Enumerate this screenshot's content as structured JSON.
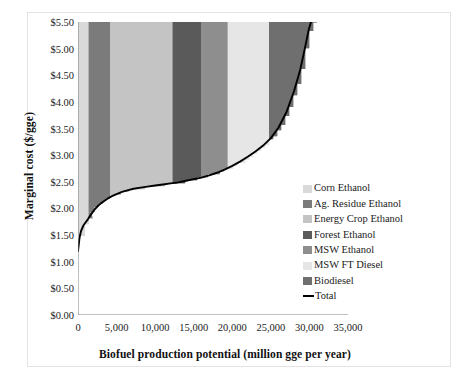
{
  "chart_data": {
    "type": "area",
    "title": "",
    "xlabel": "Biofuel production potential (million gge per year)",
    "ylabel": "Marginal cost ($/gge)",
    "xlim": [
      0,
      35000
    ],
    "ylim": [
      0.0,
      5.5
    ],
    "xticks": [
      "0",
      "5,000",
      "10,000",
      "15,000",
      "20,000",
      "25,000",
      "30,000",
      "35,000"
    ],
    "xtick_values": [
      0,
      5000,
      10000,
      15000,
      20000,
      25000,
      30000,
      35000
    ],
    "yticks": [
      "$0.00",
      "$0.50",
      "$1.00",
      "$1.50",
      "$2.00",
      "$2.50",
      "$3.00",
      "$3.50",
      "$4.00",
      "$4.50",
      "$5.00",
      "$5.50"
    ],
    "ytick_values": [
      0.0,
      0.5,
      1.0,
      1.5,
      2.0,
      2.5,
      3.0,
      3.5,
      4.0,
      4.5,
      5.0,
      5.5
    ],
    "grid": false,
    "legend_position": "right-inside",
    "series": [
      {
        "name": "Corn Ethanol",
        "color": "#d9d9d9",
        "x_start": 0,
        "x_end": 1400
      },
      {
        "name": "Ag. Residue Ethanol",
        "color": "#7b7b7b",
        "x_start": 1400,
        "x_end": 4200
      },
      {
        "name": "Energy Crop Ethanol",
        "color": "#c4c4c4",
        "x_start": 4200,
        "x_end": 12300
      },
      {
        "name": "Forest Ethanol",
        "color": "#5a5a5a",
        "x_start": 12300,
        "x_end": 16000
      },
      {
        "name": "MSW Ethanol",
        "color": "#8e8e8e",
        "x_start": 16000,
        "x_end": 19400
      },
      {
        "name": "MSW FT Diesel",
        "color": "#e6e6e6",
        "x_start": 19400,
        "x_end": 24800
      },
      {
        "name": "Biodiesel",
        "color": "#6f6f6f",
        "x_start": 24800,
        "x_end": 31000
      },
      {
        "name": "Total",
        "color": "#000000",
        "is_line": true
      }
    ],
    "total_curve": [
      [
        0,
        1.2
      ],
      [
        200,
        1.45
      ],
      [
        400,
        1.58
      ],
      [
        700,
        1.68
      ],
      [
        1000,
        1.74
      ],
      [
        1300,
        1.8
      ],
      [
        1600,
        1.87
      ],
      [
        1900,
        1.93
      ],
      [
        2200,
        1.99
      ],
      [
        2600,
        2.05
      ],
      [
        3000,
        2.1
      ],
      [
        3400,
        2.14
      ],
      [
        3900,
        2.19
      ],
      [
        4400,
        2.23
      ],
      [
        5000,
        2.27
      ],
      [
        5700,
        2.31
      ],
      [
        6400,
        2.34
      ],
      [
        7200,
        2.37
      ],
      [
        8100,
        2.39
      ],
      [
        9000,
        2.41
      ],
      [
        10000,
        2.43
      ],
      [
        11000,
        2.45
      ],
      [
        12000,
        2.47
      ],
      [
        13000,
        2.49
      ],
      [
        14000,
        2.52
      ],
      [
        15000,
        2.55
      ],
      [
        16000,
        2.58
      ],
      [
        17000,
        2.62
      ],
      [
        18000,
        2.67
      ],
      [
        19000,
        2.73
      ],
      [
        20000,
        2.8
      ],
      [
        21000,
        2.88
      ],
      [
        22000,
        2.97
      ],
      [
        23000,
        3.07
      ],
      [
        24000,
        3.18
      ],
      [
        25000,
        3.32
      ],
      [
        26000,
        3.52
      ],
      [
        27000,
        3.8
      ],
      [
        28000,
        4.2
      ],
      [
        28800,
        4.6
      ],
      [
        29400,
        5.0
      ],
      [
        29900,
        5.35
      ],
      [
        30200,
        5.5
      ]
    ],
    "staircase_top": [
      [
        0,
        2.46
      ],
      [
        1400,
        2.46
      ],
      [
        1400,
        2.46
      ],
      [
        4200,
        2.46
      ],
      [
        4200,
        5.5
      ],
      [
        12300,
        5.5
      ],
      [
        12300,
        5.5
      ],
      [
        16000,
        5.5
      ],
      [
        16000,
        5.5
      ],
      [
        19400,
        5.5
      ],
      [
        19400,
        5.5
      ],
      [
        24800,
        5.5
      ],
      [
        24800,
        5.5
      ],
      [
        31000,
        5.5
      ]
    ]
  },
  "legend": {
    "items": [
      {
        "label": "Corn Ethanol",
        "color": "#d9d9d9"
      },
      {
        "label": "Ag. Residue Ethanol",
        "color": "#7b7b7b"
      },
      {
        "label": "Energy Crop Ethanol",
        "color": "#c4c4c4"
      },
      {
        "label": "Forest Ethanol",
        "color": "#5a5a5a"
      },
      {
        "label": "MSW Ethanol",
        "color": "#8e8e8e"
      },
      {
        "label": "MSW FT Diesel",
        "color": "#e6e6e6"
      },
      {
        "label": "Biodiesel",
        "color": "#6f6f6f"
      },
      {
        "label": "Total",
        "color": "#000000"
      }
    ]
  }
}
